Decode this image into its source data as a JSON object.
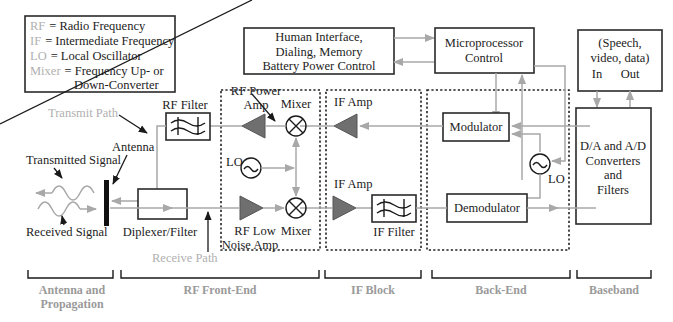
{
  "legend": {
    "items": [
      {
        "abbr": "RF",
        "definition": "= Radio Frequency"
      },
      {
        "abbr": "IF",
        "definition": "= Intermediate Frequency"
      },
      {
        "abbr": "LO",
        "definition": "= Local Oscillator"
      },
      {
        "abbr": "Mixer",
        "definition": "= Frequency Up- or"
      }
    ],
    "continuation": "Down-Converter"
  },
  "blocks": {
    "human_interface": [
      "Human Interface,",
      "Dialing, Memory",
      "Battery Power Control"
    ],
    "microprocessor": [
      "Microprocessor",
      "Control"
    ],
    "baseband_io": [
      "(Speech,",
      "video, data)"
    ],
    "baseband_in": "In",
    "baseband_out": "Out",
    "converters": [
      "D/A and A/D",
      "Converters",
      "and",
      "Filters"
    ],
    "modulator": "Modulator",
    "demodulator": "Demodulator",
    "diplexer": "Diplexer/Filter",
    "rf_filter": "RF Filter",
    "if_filter": "IF Filter"
  },
  "labels": {
    "rf_power_amp": [
      "RF Power",
      "Amp"
    ],
    "mixer_top": "Mixer",
    "mixer_bottom": "Mixer",
    "lo_front": "LO",
    "lo_back": "LO",
    "if_amp_top": "IF Amp",
    "if_amp_bottom": "IF Amp",
    "rf_low_noise_amp": [
      "RF Low",
      "Noise Amp"
    ],
    "transmit_path": "Transmit Path",
    "receive_path": "Receive Path",
    "antenna": "Antenna",
    "transmitted_signal": "Transmitted Signal",
    "received_signal": "Received Signal"
  },
  "sections": [
    {
      "name": "Antenna and",
      "name2": "Propagation"
    },
    {
      "name": "RF Front-End"
    },
    {
      "name": "IF Block"
    },
    {
      "name": "Back-End"
    },
    {
      "name": "Baseband"
    }
  ],
  "colors": {
    "wire": "#a8a8a8",
    "amplifier": "#6f6f6f",
    "section_label": "#9a9a9a",
    "path_label": "#b0b0b0"
  }
}
